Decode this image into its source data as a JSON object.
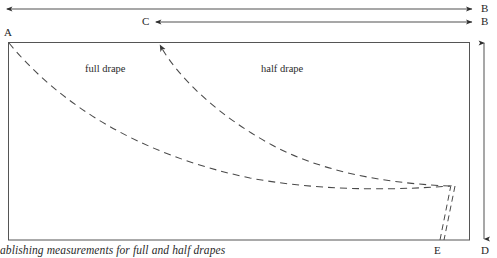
{
  "figure": {
    "caption": "ablishing measurements for full and half drapes",
    "stroke_color": "#3d3d3d",
    "text_color": "#262626",
    "background": "#ffffff"
  },
  "labels": {
    "a": "A",
    "b_top": "B",
    "b_second": "B",
    "c": "C",
    "d": "D",
    "e": "E"
  },
  "regions": {
    "full_drape": "full drape",
    "half_drape": "half drape"
  },
  "dimension_arrows": [
    {
      "name": "a-to-b-width",
      "from": "A",
      "to": "B",
      "orientation": "horizontal",
      "heads": "both"
    },
    {
      "name": "c-to-b-width",
      "from": "C",
      "to": "B",
      "orientation": "horizontal",
      "heads": "both"
    },
    {
      "name": "vertical-depth",
      "from": "top",
      "to": "D",
      "orientation": "vertical",
      "heads": "both"
    }
  ]
}
